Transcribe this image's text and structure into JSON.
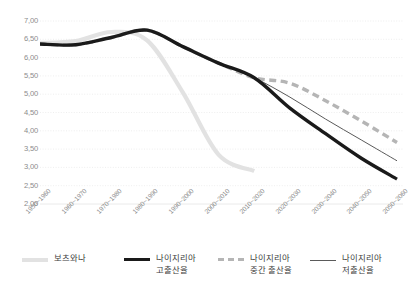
{
  "chart_data": {
    "type": "line",
    "title": "",
    "xlabel": "",
    "ylabel": "",
    "ylim": [
      2.0,
      7.0
    ],
    "y_ticks": [
      "7,00",
      "6,50",
      "6,00",
      "5,50",
      "5,00",
      "4,50",
      "4,00",
      "3,50",
      "3,00",
      "2,50",
      "2,00"
    ],
    "y_tick_values": [
      7.0,
      6.5,
      6.0,
      5.5,
      5.0,
      4.5,
      4.0,
      3.5,
      3.0,
      2.5,
      2.0
    ],
    "grid": true,
    "legend_position": "bottom",
    "categories": [
      "1950~1960",
      "1960~1970",
      "1970~1980",
      "1980~1990",
      "1990~2000",
      "2000~2010",
      "2010~2020",
      "2020~2030",
      "2030~2040",
      "2040~2050",
      "2050~2060"
    ],
    "series": [
      {
        "name": "보츠와나",
        "style": "thick-light",
        "color": "#e2e2e2",
        "values": [
          6.4,
          6.45,
          6.7,
          6.47,
          5.05,
          3.35,
          2.9,
          null,
          null,
          null,
          null
        ]
      },
      {
        "name": "나이지리아 고출산율",
        "style": "thick-solid",
        "color": "#1a1a1a",
        "values": [
          6.37,
          6.35,
          6.55,
          6.75,
          6.3,
          5.85,
          5.45,
          4.62,
          3.92,
          3.25,
          2.68
        ]
      },
      {
        "name": "나이지리아 중간 출산율",
        "style": "thick-dashed",
        "color": "#b5b5b5",
        "values": [
          6.37,
          6.35,
          6.55,
          6.75,
          6.3,
          5.85,
          5.45,
          5.3,
          4.82,
          4.27,
          3.68
        ]
      },
      {
        "name": "나이지리아 저출산율",
        "style": "thin-solid",
        "color": "#5a5a5a",
        "values": [
          6.37,
          6.35,
          6.55,
          6.75,
          6.3,
          5.85,
          5.45,
          4.92,
          4.32,
          3.75,
          3.18
        ]
      }
    ]
  },
  "legend": {
    "items": [
      {
        "key": "botswana",
        "line1": "보츠와나",
        "line2": ""
      },
      {
        "key": "nigeria-high",
        "line1": "나이지리아",
        "line2": "고출산율"
      },
      {
        "key": "nigeria-medium",
        "line1": "나이지리아",
        "line2": "중간 출산율"
      },
      {
        "key": "nigeria-low",
        "line1": "나이지리아",
        "line2": "저출산율"
      }
    ]
  },
  "colors": {
    "botswana": "#e2e2e2",
    "nigeria_high": "#1a1a1a",
    "nigeria_medium": "#b5b5b5",
    "nigeria_low": "#5a5a5a",
    "grid": "#eaeaea",
    "tick_text": "#8c8c8c",
    "legend_text": "#3d3d3d",
    "background": "#ffffff"
  }
}
